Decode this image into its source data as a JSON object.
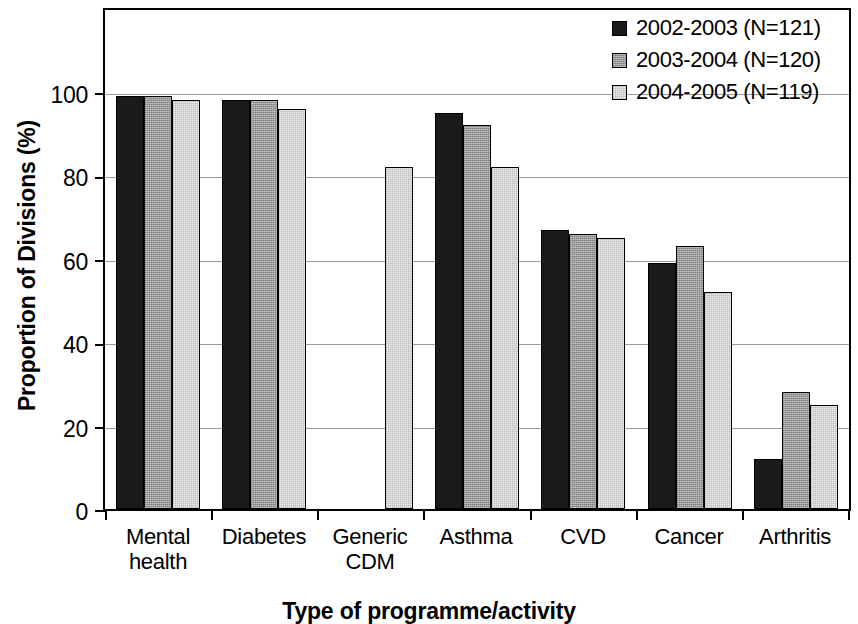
{
  "chart_data": {
    "type": "bar",
    "title": "",
    "xlabel": "Type of programme/activity",
    "ylabel": "Proportion of Divisions (%)",
    "ylim": [
      0,
      100
    ],
    "yticks": [
      0,
      20,
      40,
      60,
      80,
      100
    ],
    "grid": true,
    "legend_position": "top-right",
    "categories": [
      "Mental health",
      "Diabetes",
      "Generic CDM",
      "Asthma",
      "CVD",
      "Cancer",
      "Arthritis"
    ],
    "category_lines": [
      [
        "Mental",
        "health"
      ],
      [
        "Diabetes",
        ""
      ],
      [
        "Generic",
        "CDM"
      ],
      [
        "Asthma",
        ""
      ],
      [
        "CVD",
        ""
      ],
      [
        "Cancer",
        ""
      ],
      [
        "Arthritis",
        ""
      ]
    ],
    "series": [
      {
        "name": "2002-2003 (N=121)",
        "color": "#1a1a1a",
        "values": [
          99,
          98,
          0,
          95,
          67,
          59,
          12
        ]
      },
      {
        "name": "2003-2004 (N=120)",
        "color": "#9b9b9b",
        "values": [
          99,
          98,
          0,
          92,
          66,
          63,
          28
        ]
      },
      {
        "name": "2004-2005 (N=119)",
        "color": "#ececec",
        "values": [
          98,
          96,
          82,
          82,
          65,
          52,
          25
        ]
      }
    ]
  },
  "axis": {
    "y_title": "Proportion of Divisions (%)",
    "x_title": "Type of programme/activity",
    "y_tick_labels": [
      "100",
      "80",
      "60",
      "40",
      "20",
      "0"
    ]
  },
  "legend": {
    "items": [
      {
        "label": "2002-2003 (N=121)",
        "swatch": "dark-swatch"
      },
      {
        "label": "2003-2004 (N=120)",
        "swatch": "medium-swatch"
      },
      {
        "label": "2004-2005 (N=119)",
        "swatch": "light-swatch"
      }
    ]
  },
  "categories_display": [
    {
      "line1": "Mental",
      "line2": "health"
    },
    {
      "line1": "Diabetes",
      "line2": ""
    },
    {
      "line1": "Generic",
      "line2": "CDM"
    },
    {
      "line1": "Asthma",
      "line2": ""
    },
    {
      "line1": "CVD",
      "line2": ""
    },
    {
      "line1": "Cancer",
      "line2": ""
    },
    {
      "line1": "Arthritis",
      "line2": ""
    }
  ]
}
